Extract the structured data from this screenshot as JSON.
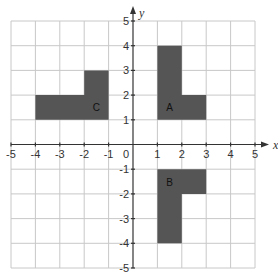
{
  "diagram": {
    "type": "coordinate-grid",
    "x_axis": {
      "label": "x",
      "min": -5,
      "max": 5,
      "ticks": [
        -5,
        -4,
        -3,
        -2,
        -1,
        1,
        2,
        3,
        4,
        5
      ]
    },
    "y_axis": {
      "label": "y",
      "min": -5,
      "max": 5,
      "ticks": [
        -5,
        -4,
        -3,
        -2,
        -1,
        1,
        2,
        3,
        4,
        5
      ]
    },
    "origin_label": "0",
    "colors": {
      "shape_fill": "#555555",
      "grid": "#c8c8c8",
      "axis": "#333333"
    },
    "shapes": [
      {
        "name": "A",
        "vertices": [
          [
            1,
            1
          ],
          [
            1,
            4
          ],
          [
            2,
            4
          ],
          [
            2,
            2
          ],
          [
            3,
            2
          ],
          [
            3,
            1
          ]
        ],
        "label_at": [
          1.5,
          1.5
        ]
      },
      {
        "name": "B",
        "vertices": [
          [
            1,
            -1
          ],
          [
            3,
            -1
          ],
          [
            3,
            -2
          ],
          [
            2,
            -2
          ],
          [
            2,
            -4
          ],
          [
            1,
            -4
          ]
        ],
        "label_at": [
          1.5,
          -1.5
        ]
      },
      {
        "name": "C",
        "vertices": [
          [
            -4,
            1
          ],
          [
            -4,
            2
          ],
          [
            -2,
            2
          ],
          [
            -2,
            3
          ],
          [
            -1,
            3
          ],
          [
            -1,
            1
          ]
        ],
        "label_at": [
          -1.5,
          1.5
        ]
      }
    ]
  }
}
